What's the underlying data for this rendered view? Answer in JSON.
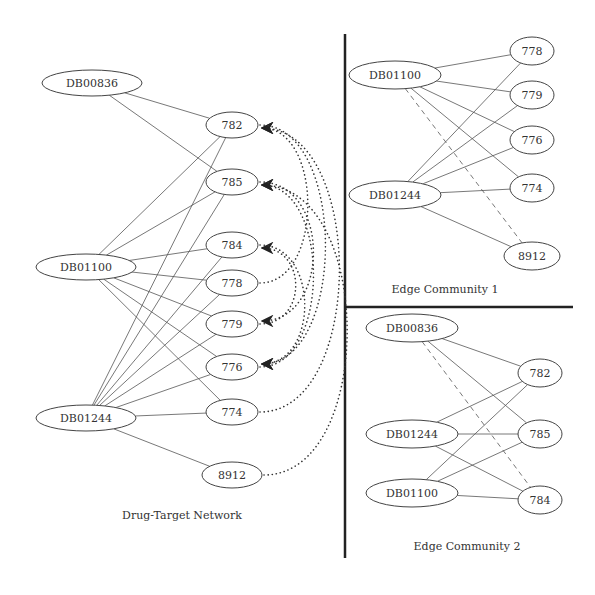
{
  "panels": {
    "main": {
      "caption": "Drug-Target Network",
      "drugs": [
        {
          "id": "DB00836",
          "x": 92,
          "y": 83,
          "rx": 50,
          "ry": 13
        },
        {
          "id": "DB01100",
          "x": 86,
          "y": 267,
          "rx": 50,
          "ry": 13
        },
        {
          "id": "DB01244",
          "x": 86,
          "y": 418,
          "rx": 50,
          "ry": 13
        }
      ],
      "targets": [
        {
          "id": "782",
          "x": 232,
          "y": 125,
          "rx": 26,
          "ry": 13
        },
        {
          "id": "785",
          "x": 232,
          "y": 182,
          "rx": 26,
          "ry": 13
        },
        {
          "id": "784",
          "x": 232,
          "y": 245,
          "rx": 26,
          "ry": 13
        },
        {
          "id": "778",
          "x": 232,
          "y": 283,
          "rx": 26,
          "ry": 13
        },
        {
          "id": "779",
          "x": 232,
          "y": 324,
          "rx": 26,
          "ry": 13
        },
        {
          "id": "776",
          "x": 232,
          "y": 367,
          "rx": 26,
          "ry": 13
        },
        {
          "id": "774",
          "x": 232,
          "y": 412,
          "rx": 26,
          "ry": 13
        },
        {
          "id": "8912",
          "x": 232,
          "y": 475,
          "rx": 30,
          "ry": 13
        }
      ],
      "edges": [
        [
          "DB00836",
          "782"
        ],
        [
          "DB00836",
          "785"
        ],
        [
          "DB01100",
          "782"
        ],
        [
          "DB01100",
          "785"
        ],
        [
          "DB01100",
          "784"
        ],
        [
          "DB01100",
          "778"
        ],
        [
          "DB01100",
          "779"
        ],
        [
          "DB01100",
          "776"
        ],
        [
          "DB01100",
          "774"
        ],
        [
          "DB01244",
          "782"
        ],
        [
          "DB01244",
          "785"
        ],
        [
          "DB01244",
          "784"
        ],
        [
          "DB01244",
          "778"
        ],
        [
          "DB01244",
          "779"
        ],
        [
          "DB01244",
          "776"
        ],
        [
          "DB01244",
          "774"
        ],
        [
          "DB01244",
          "8912"
        ]
      ],
      "dotted_arcs": [
        {
          "from": "778",
          "to": "782"
        },
        {
          "from": "774",
          "to": "782"
        },
        {
          "from": "8912",
          "to": "785"
        },
        {
          "from": "776",
          "to": "785"
        },
        {
          "from": "779",
          "to": "784"
        },
        {
          "from": "785",
          "to": "779"
        },
        {
          "from": "782",
          "to": "776"
        },
        {
          "from": "784",
          "to": "776"
        }
      ]
    },
    "community1": {
      "caption": "Edge Community 1",
      "drugs": [
        {
          "id": "DB01100",
          "x": 395,
          "y": 75,
          "rx": 46,
          "ry": 14
        },
        {
          "id": "DB01244",
          "x": 395,
          "y": 195,
          "rx": 46,
          "ry": 14
        }
      ],
      "targets": [
        {
          "id": "778",
          "x": 532,
          "y": 51,
          "rx": 22,
          "ry": 14
        },
        {
          "id": "779",
          "x": 532,
          "y": 95,
          "rx": 22,
          "ry": 14
        },
        {
          "id": "776",
          "x": 532,
          "y": 140,
          "rx": 22,
          "ry": 14
        },
        {
          "id": "774",
          "x": 532,
          "y": 188,
          "rx": 22,
          "ry": 14
        },
        {
          "id": "8912",
          "x": 532,
          "y": 256,
          "rx": 28,
          "ry": 14
        }
      ],
      "edges": [
        [
          "DB01100",
          "778"
        ],
        [
          "DB01100",
          "779"
        ],
        [
          "DB01100",
          "776"
        ],
        [
          "DB01100",
          "774"
        ],
        [
          "DB01244",
          "778"
        ],
        [
          "DB01244",
          "779"
        ],
        [
          "DB01244",
          "776"
        ],
        [
          "DB01244",
          "774"
        ],
        [
          "DB01244",
          "8912"
        ]
      ],
      "dashed_edges": [
        [
          "DB01100",
          "8912"
        ]
      ]
    },
    "community2": {
      "caption": "Edge Community 2",
      "drugs": [
        {
          "id": "DB00836",
          "x": 412,
          "y": 328,
          "rx": 46,
          "ry": 14
        },
        {
          "id": "DB01244",
          "x": 412,
          "y": 434,
          "rx": 46,
          "ry": 14
        },
        {
          "id": "DB01100",
          "x": 412,
          "y": 493,
          "rx": 46,
          "ry": 14
        }
      ],
      "targets": [
        {
          "id": "782",
          "x": 540,
          "y": 373,
          "rx": 22,
          "ry": 14
        },
        {
          "id": "785",
          "x": 540,
          "y": 434,
          "rx": 22,
          "ry": 14
        },
        {
          "id": "784",
          "x": 540,
          "y": 500,
          "rx": 22,
          "ry": 14
        }
      ],
      "edges": [
        [
          "DB00836",
          "782"
        ],
        [
          "DB00836",
          "785"
        ],
        [
          "DB01244",
          "782"
        ],
        [
          "DB01244",
          "785"
        ],
        [
          "DB01244",
          "784"
        ],
        [
          "DB01100",
          "782"
        ],
        [
          "DB01100",
          "785"
        ],
        [
          "DB01100",
          "784"
        ]
      ],
      "dashed_edges": [
        [
          "DB00836",
          "784"
        ]
      ]
    }
  },
  "dividers": {
    "vertical": {
      "x": 345,
      "y1": 34,
      "y2": 558
    },
    "horizontal": {
      "x1": 345,
      "x2": 573,
      "y": 307
    }
  },
  "captions_pos": {
    "main": {
      "x": 182,
      "y": 519
    },
    "community1": {
      "x": 445,
      "y": 293
    },
    "community2": {
      "x": 467,
      "y": 550
    }
  }
}
